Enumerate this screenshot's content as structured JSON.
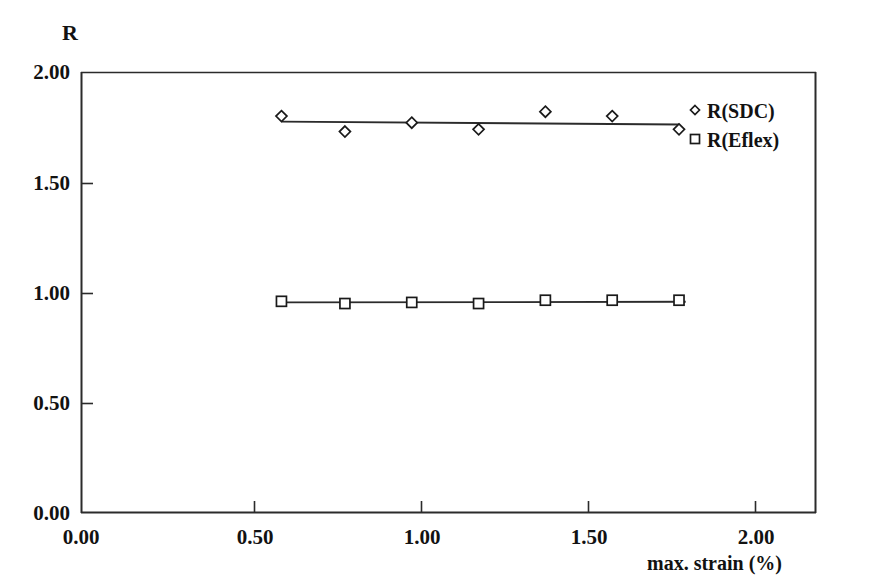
{
  "chart_data": {
    "type": "scatter",
    "title": "",
    "xlabel": "max. strain (%)",
    "ylabel": "R",
    "xlim": [
      0.0,
      2.2
    ],
    "ylim": [
      0.0,
      2.0
    ],
    "xticks": [
      "0.00",
      "0.50",
      "1.00",
      "1.50",
      "2.00"
    ],
    "xtick_values": [
      0.0,
      0.5,
      1.0,
      1.5,
      2.0
    ],
    "yticks": [
      "0.00",
      "0.50",
      "1.00",
      "1.50",
      "2.00"
    ],
    "ytick_values": [
      0.0,
      0.5,
      1.0,
      1.5,
      2.0
    ],
    "grid": false,
    "legend_position": "top-right",
    "series": [
      {
        "name": "R(SDC)",
        "marker": "diamond",
        "trendline": true,
        "x": [
          0.6,
          0.79,
          0.99,
          1.19,
          1.39,
          1.59,
          1.79
        ],
        "y": [
          1.8,
          1.73,
          1.77,
          1.74,
          1.82,
          1.8,
          1.74
        ]
      },
      {
        "name": "R(Eflex)",
        "marker": "square",
        "trendline": true,
        "x": [
          0.6,
          0.79,
          0.99,
          1.19,
          1.39,
          1.59,
          1.79
        ],
        "y": [
          0.96,
          0.95,
          0.955,
          0.95,
          0.965,
          0.965,
          0.965
        ]
      }
    ],
    "trendlines": [
      {
        "name": "R(SDC)",
        "x0": 0.6,
        "y0": 1.775,
        "x1": 1.79,
        "y1": 1.762
      },
      {
        "name": "R(Eflex)",
        "x0": 0.6,
        "y0": 0.955,
        "x1": 1.81,
        "y1": 0.958
      }
    ]
  },
  "axes": {
    "y_title": "R",
    "x_title": "max. strain (%)",
    "y_tick_labels": [
      "2.00",
      "1.50",
      "1.00",
      "0.50",
      "0.00"
    ],
    "x_tick_labels": [
      "0.00",
      "0.50",
      "1.00",
      "1.50",
      "2.00"
    ]
  },
  "legend": {
    "entries": [
      {
        "label": "R(SDC)",
        "marker": "diamond"
      },
      {
        "label": "R(Eflex)",
        "marker": "square"
      }
    ]
  },
  "colors": {
    "axis": "#2b2b2b",
    "marker_stroke": "#1a1a1a",
    "marker_fill": "#ffffff",
    "line": "#2b2b2b",
    "text": "#121212",
    "background": "#ffffff"
  }
}
